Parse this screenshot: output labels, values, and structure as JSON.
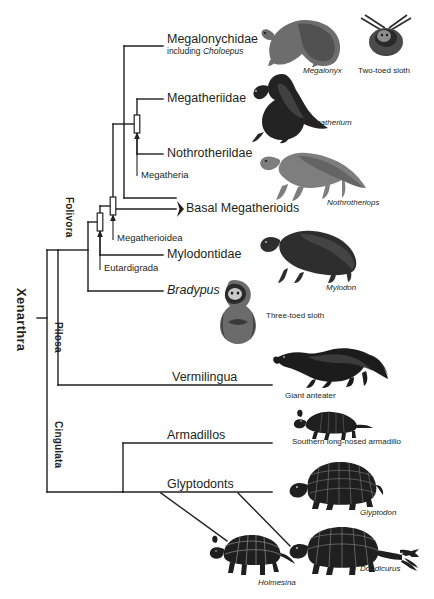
{
  "diagram": {
    "root_label": "Xenarthra",
    "line_color": "#231f20"
  },
  "clades": [
    {
      "id": "folivora",
      "label": "Folivora",
      "orientation": "vertical"
    },
    {
      "id": "pilosa",
      "label": "Pilosa",
      "orientation": "vertical"
    },
    {
      "id": "cingulata",
      "label": "Cingulata",
      "orientation": "vertical"
    }
  ],
  "node_labels": [
    {
      "id": "megatheria",
      "label": "Megatheria"
    },
    {
      "id": "megatherioidea",
      "label": "Megatherioidea"
    },
    {
      "id": "eutardigrada",
      "label": "Eutardigrada"
    }
  ],
  "tips": [
    {
      "id": "megalonychidae",
      "label": "Megalonychidae",
      "sub_prefix": "including ",
      "sub_italic": "Choloepus"
    },
    {
      "id": "megatheriidae",
      "label": "Megatheriidae"
    },
    {
      "id": "nothrotherildae",
      "label": "Nothrotherildae"
    },
    {
      "id": "basal-megatherioids",
      "label": "Basal Megatherioids",
      "marker": "chevron"
    },
    {
      "id": "mylodontidae",
      "label": "Mylodontidae"
    },
    {
      "id": "bradypus",
      "label": "Bradypus",
      "italic": true
    },
    {
      "id": "vermilingua",
      "label": "Vermilingua"
    },
    {
      "id": "armadillos",
      "label": "Armadillos"
    },
    {
      "id": "glyptodonts",
      "label": "Glyptodonts"
    }
  ],
  "illustrations": [
    {
      "id": "megalonyx",
      "caption": "Megalonyx",
      "italic": true
    },
    {
      "id": "two-toed-sloth",
      "caption": "Two-toed sloth",
      "italic": false
    },
    {
      "id": "megatherium",
      "caption": "Megatherium",
      "italic": true
    },
    {
      "id": "nothrotheriops",
      "caption": "Nothrotheriops",
      "italic": true
    },
    {
      "id": "mylodon",
      "caption": "Mylodon",
      "italic": true
    },
    {
      "id": "three-toed-sloth",
      "caption": "Three-toed sloth",
      "italic": false
    },
    {
      "id": "giant-anteater",
      "caption": "Giant anteater",
      "italic": false
    },
    {
      "id": "southern-long-nosed-armadillo",
      "caption": "Southern long-nosed armadillo",
      "italic": false
    },
    {
      "id": "glyptodon",
      "caption": "Glyptodon",
      "italic": true
    },
    {
      "id": "holmesina",
      "caption": "Holmesina",
      "italic": true
    },
    {
      "id": "doedicurus",
      "caption": "Doedicurus",
      "italic": true
    }
  ]
}
